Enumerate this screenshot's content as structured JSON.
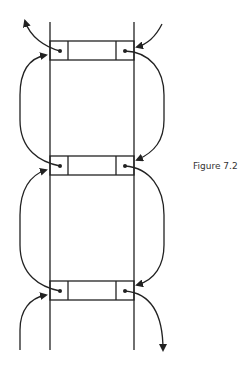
{
  "figure": {
    "caption": "Figure 7.2",
    "nodes": [
      {
        "id": "node-1",
        "fields": [
          "prev-link",
          "data",
          "next-link"
        ]
      },
      {
        "id": "node-2",
        "fields": [
          "prev-link",
          "data",
          "next-link"
        ]
      },
      {
        "id": "node-3",
        "fields": [
          "prev-link",
          "data",
          "next-link"
        ]
      }
    ],
    "stroke_color": "#222222"
  }
}
